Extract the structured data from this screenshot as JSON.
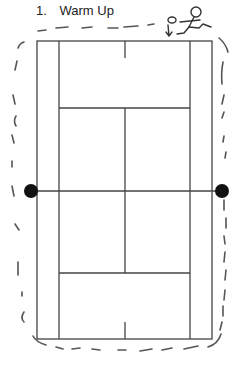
{
  "diagram": {
    "title_number": "1.",
    "title_text": "Warm Up",
    "colors": {
      "line": "#444444",
      "dash": "#555555",
      "marker": "#111111"
    },
    "court": {
      "outer": {
        "x1": 37,
        "y1": 41,
        "x2": 212,
        "y2": 339
      },
      "singles_left_x": 59,
      "singles_right_x": 190,
      "center_x": 125,
      "service_line_top_y": 108,
      "service_line_bottom_y": 273,
      "net_y": 191
    },
    "net_posts": [
      {
        "name": "left-net-post",
        "cx": 31,
        "cy": 191,
        "r": 7
      },
      {
        "name": "right-net-post",
        "cx": 222,
        "cy": 191,
        "r": 7
      }
    ],
    "runner": {
      "label": "stick figure running with ball",
      "arrow": "down"
    },
    "path": {
      "style": "dashed",
      "description": "warm-up jog route around the court"
    }
  }
}
